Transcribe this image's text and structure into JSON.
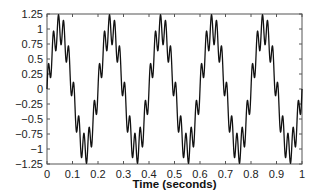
{
  "chart_data": {
    "type": "line",
    "title": "",
    "xlabel": "Time (seconds)",
    "ylabel": "",
    "xlim": [
      0,
      1
    ],
    "ylim": [
      -1.25,
      1.25
    ],
    "grid": false,
    "legend": null,
    "x_ticks": [
      "0",
      "0.1",
      "0.2",
      "0.3",
      "0.4",
      "0.5",
      "0.6",
      "0.7",
      "0.8",
      "0.9",
      "1"
    ],
    "y_ticks": [
      "1.25",
      "1",
      "0.75",
      "0.5",
      "0.25",
      "0",
      "−0.25",
      "−0.5",
      "−0.75",
      "−1",
      "−1.25"
    ],
    "series": [
      {
        "name": "signal",
        "color": "#111111",
        "description": "5 Hz sine (amplitude ~1) plus ~50 Hz ripple (amplitude ~0.25)",
        "model": {
          "f1": 5,
          "a1": 1.0,
          "f2": 50,
          "a2": 0.25
        },
        "approx_points": {
          "x": [
            0,
            0.05,
            0.1,
            0.15,
            0.2,
            0.25,
            0.3,
            0.35,
            0.4,
            0.45,
            0.5,
            0.55,
            0.6,
            0.65,
            0.7,
            0.75,
            0.8,
            0.85,
            0.9,
            0.95,
            1.0
          ],
          "y": [
            0.0,
            1.0,
            0.0,
            -1.0,
            0.0,
            1.0,
            0.0,
            -1.0,
            0.0,
            1.0,
            0.0,
            -1.0,
            0.0,
            1.0,
            0.0,
            -1.0,
            0.0,
            1.0,
            0.0,
            -1.0,
            0.0
          ]
        },
        "peak_max": 1.2,
        "peak_min": -1.2
      }
    ]
  }
}
